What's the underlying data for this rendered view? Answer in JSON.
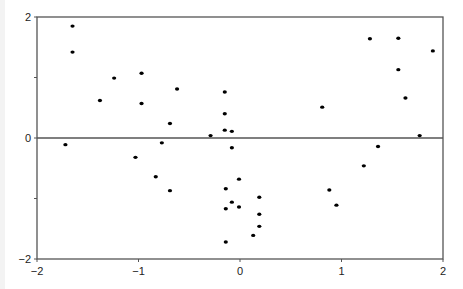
{
  "chart_data": {
    "type": "scatter",
    "title": "",
    "xlabel": "",
    "ylabel": "",
    "xlim": [
      -2,
      2
    ],
    "ylim": [
      -2,
      2
    ],
    "grid": false,
    "legend": null,
    "reference_lines": [
      {
        "orientation": "horizontal",
        "y": 0
      }
    ],
    "x_ticks": [
      -2,
      -1,
      0,
      1,
      2
    ],
    "x_tick_labels": [
      "−2",
      "−1",
      "0",
      "1",
      "2"
    ],
    "y_ticks": [
      -2,
      -1,
      0,
      1,
      2
    ],
    "y_tick_labels": [
      "−2",
      "",
      "0",
      "",
      "2"
    ],
    "marker_color": "#000000",
    "series": [
      {
        "name": "points",
        "x": [
          -1.65,
          -1.65,
          -1.24,
          -0.97,
          -1.38,
          -0.97,
          -0.62,
          -0.69,
          -0.15,
          -0.15,
          -0.15,
          -0.08,
          -0.29,
          -0.08,
          -1.72,
          -1.03,
          -0.77,
          -0.83,
          -0.69,
          -0.01,
          -0.14,
          0.19,
          -0.08,
          -0.01,
          -0.14,
          0.19,
          0.19,
          0.13,
          -0.14,
          1.28,
          1.56,
          1.9,
          1.56,
          1.63,
          0.81,
          1.77,
          1.36,
          1.22,
          0.88,
          0.95
        ],
        "y": [
          1.85,
          1.42,
          0.99,
          1.07,
          0.62,
          0.57,
          0.81,
          0.24,
          0.76,
          0.4,
          0.13,
          0.11,
          0.04,
          -0.16,
          -0.11,
          -0.32,
          -0.08,
          -0.64,
          -0.87,
          -0.68,
          -0.84,
          -0.98,
          -1.06,
          -1.14,
          -1.17,
          -1.26,
          -1.46,
          -1.61,
          -1.72,
          1.64,
          1.65,
          1.44,
          1.13,
          0.66,
          0.51,
          0.04,
          -0.14,
          -0.46,
          -0.86,
          -1.11
        ]
      }
    ]
  }
}
